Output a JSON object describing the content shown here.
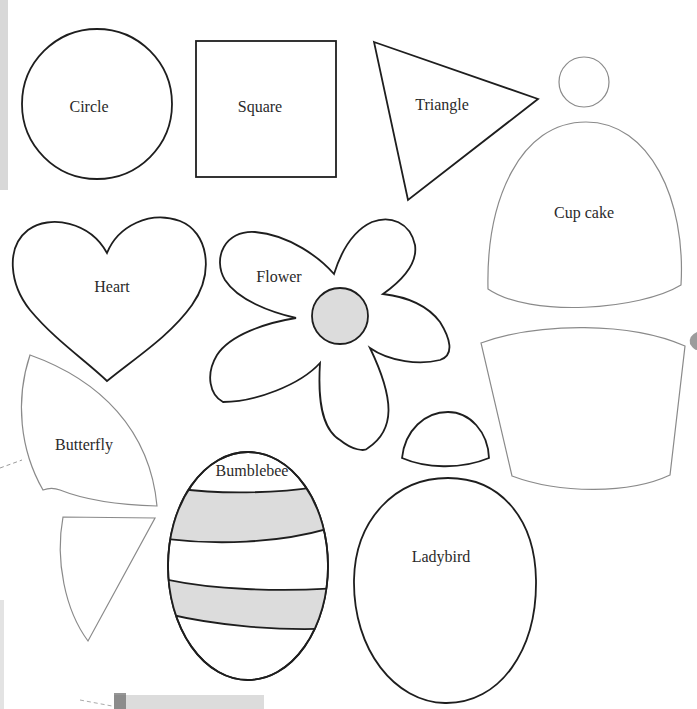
{
  "page": {
    "background": "#ffffff",
    "outline_color": "#1e1e1e",
    "light_outline_color": "#8a8a8a",
    "fill_shade_color": "#dcdcdc"
  },
  "shapes": {
    "circle": {
      "label": "Circle"
    },
    "square": {
      "label": "Square"
    },
    "triangle": {
      "label": "Triangle"
    },
    "cupcake": {
      "label": "Cup cake"
    },
    "heart": {
      "label": "Heart"
    },
    "flower": {
      "label": "Flower"
    },
    "butterfly": {
      "label": "Butterfly"
    },
    "bumblebee": {
      "label": "Bumblebee"
    },
    "ladybird": {
      "label": "Ladybird"
    }
  }
}
